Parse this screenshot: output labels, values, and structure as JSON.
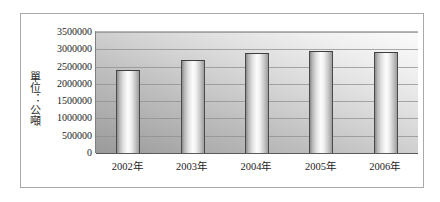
{
  "chart_data": {
    "type": "bar",
    "title": "",
    "subtitle": "",
    "xlabel": "",
    "ylabel": "單位：公噸",
    "categories": [
      "2002年",
      "2003年",
      "2004年",
      "2005年",
      "2006年"
    ],
    "values": [
      2400000,
      2700000,
      2880000,
      2950000,
      2920000
    ],
    "series": [
      {
        "name": "",
        "values": [
          2400000,
          2700000,
          2880000,
          2950000,
          2920000
        ]
      }
    ],
    "ylim": [
      0,
      3500000
    ],
    "ytick_values": [
      0,
      500000,
      1000000,
      1500000,
      2000000,
      2500000,
      3000000,
      3500000
    ],
    "ytick_labels": [
      "0",
      "500000",
      "1000000",
      "1500000",
      "2000000",
      "2500000",
      "3000000",
      "3500000"
    ],
    "grid": true,
    "grid_axis": "y",
    "legend": false,
    "legend_position": "none",
    "bar_style": "cylinder-3d",
    "colors": {
      "bar_light": "#fdfdfd",
      "bar_mid": "#c9c9c9",
      "bar_dark": "#8d8d8d",
      "bar_outline": "#4a4a4a",
      "plot_background_dark": "#9a9a9a",
      "plot_background_light": "#fbfbfb",
      "gridline": "#8f8f8f",
      "axis": "#5a5a5a",
      "frame_border": "#a9a9a9",
      "text": "#1c1c1c",
      "page_background": "#ffffff"
    }
  }
}
